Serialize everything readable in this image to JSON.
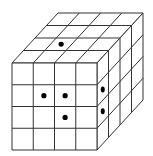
{
  "figure": {
    "type": "cube-grid-puzzle",
    "grid_size": 4,
    "cut_text": "",
    "colors": {
      "line": "#333333",
      "dot": "#000000",
      "face": "#ffffff"
    },
    "geometry": {
      "front": {
        "x0": 12,
        "y0": 63,
        "x1": 97,
        "y1": 150
      },
      "depth": {
        "dx": 46,
        "dy": -50
      }
    },
    "dots": {
      "top": [
        {
          "col": 1,
          "row": 2
        }
      ],
      "front": [
        {
          "col": 1,
          "row": 1
        },
        {
          "col": 2,
          "row": 1
        },
        {
          "col": 2,
          "row": 2
        }
      ],
      "right": [
        {
          "col": 0,
          "row": 1
        },
        {
          "col": 0,
          "row": 2
        }
      ]
    }
  }
}
